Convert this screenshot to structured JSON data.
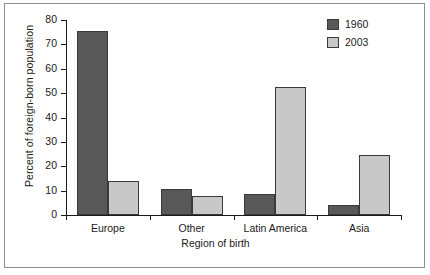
{
  "chart_data": {
    "type": "bar",
    "title": "",
    "subtitle": "",
    "xlabel": "Region of birth",
    "ylabel": "Percent of foreign-born population",
    "categories": [
      "Europe",
      "Other",
      "Latin America",
      "Asia"
    ],
    "series": [
      {
        "name": "1960",
        "color": "#585858",
        "values": [
          75.5,
          10.8,
          8.8,
          4.3
        ]
      },
      {
        "name": "2003",
        "color": "#c8c8c8",
        "values": [
          14.0,
          8.0,
          52.6,
          24.6
        ]
      }
    ],
    "ylim": [
      0,
      80
    ],
    "yticks": [
      0,
      10,
      20,
      30,
      40,
      50,
      60,
      70,
      80
    ],
    "ytick_labels": [
      "0",
      "10",
      "20",
      "30",
      "40",
      "50",
      "60",
      "70",
      "80"
    ],
    "grid": false,
    "legend_position": "top-right",
    "legend_entries": [
      "1960",
      "2003"
    ],
    "bar_edge_color": "#3a3a3a",
    "axis_color": "#1a1a1a",
    "frame_color": "#8d8d8d",
    "background": "#ffffff"
  }
}
